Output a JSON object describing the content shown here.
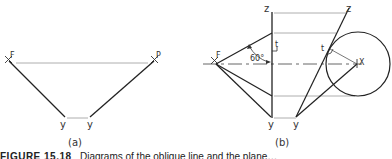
{
  "figure": {
    "panel_a": {
      "label": "(a)",
      "points": {
        "F": "F",
        "P": "P",
        "y_left": "y",
        "y_right": "y"
      }
    },
    "panel_b": {
      "label": "(b)",
      "points": {
        "z_left": "z",
        "z_right": "z",
        "F": "F",
        "t_left": "t",
        "t_right": "t",
        "X": "X",
        "y_left": "y",
        "y_right": "y"
      },
      "angle": "60°"
    },
    "caption": {
      "number": "FIGURE 15.18",
      "text": "Diagrams of the oblique line and the plane…"
    },
    "colors": {
      "line": "#333333",
      "thin_line": "#9a9a9a"
    }
  }
}
